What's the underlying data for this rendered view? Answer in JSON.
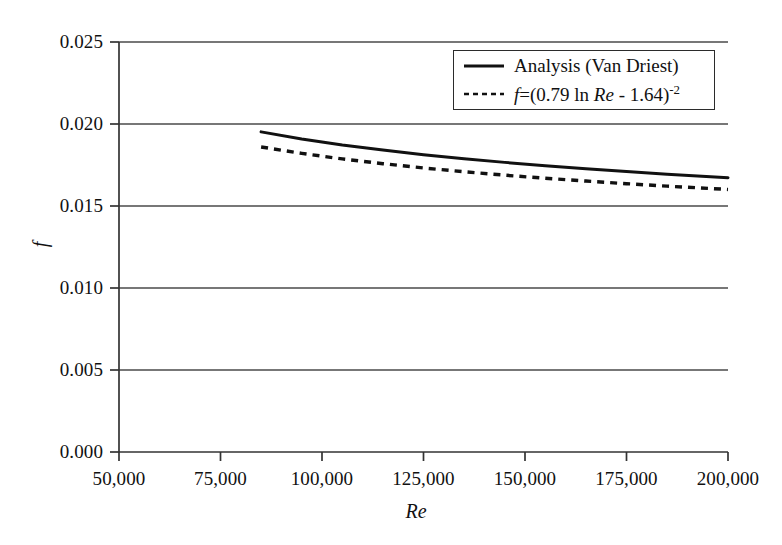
{
  "chart": {
    "type": "line",
    "xlabel": "Re",
    "ylabel": "f",
    "title": "",
    "xlim": [
      50000,
      200000
    ],
    "ylim": [
      0.0,
      0.025
    ],
    "xticks": [
      "50,000",
      "75,000",
      "100,000",
      "125,000",
      "150,000",
      "175,000",
      "200,000"
    ],
    "yticks": [
      "0.025",
      "0.020",
      "0.015",
      "0.010",
      "0.005",
      "0.000"
    ],
    "grid": "horizontal",
    "legend_position": "top-right",
    "line_color": "#111111"
  },
  "legend": {
    "items": [
      {
        "label": "Analysis (Van Driest)",
        "style": "solid"
      },
      {
        "label": "f = (0.79 ln Re - 1.64)^-2",
        "style": "dashed"
      }
    ],
    "formula": {
      "f": "f",
      "eq": "=",
      "open": "(0.79 ln",
      "re": "Re",
      "close": "- 1.64)",
      "exp": "-2"
    }
  },
  "chart_data": {
    "type": "line",
    "title": "",
    "xlabel": "Re",
    "ylabel": "f",
    "xlim": [
      50000,
      200000
    ],
    "ylim": [
      0,
      0.025
    ],
    "xticks": [
      50000,
      75000,
      100000,
      125000,
      150000,
      175000,
      200000
    ],
    "yticks": [
      0.0,
      0.005,
      0.01,
      0.015,
      0.02,
      0.025
    ],
    "grid": "horizontal gridlines at each y tick",
    "legend_position": "top-right inside plot",
    "series": [
      {
        "name": "Analysis (Van Driest)",
        "style": "solid",
        "color": "#111111",
        "x": [
          85000,
          95000,
          105000,
          115000,
          125000,
          135000,
          145000,
          155000,
          165000,
          175000,
          185000,
          200000
        ],
        "values": [
          0.01952,
          0.01909,
          0.01872,
          0.01841,
          0.01813,
          0.01788,
          0.01766,
          0.01746,
          0.01727,
          0.0171,
          0.01694,
          0.01673
        ]
      },
      {
        "name": "f = (0.79 ln Re - 1.64)^-2",
        "style": "dashed",
        "color": "#111111",
        "x": [
          85000,
          95000,
          105000,
          115000,
          125000,
          135000,
          145000,
          155000,
          165000,
          175000,
          185000,
          200000
        ],
        "values": [
          0.0186,
          0.01821,
          0.01787,
          0.01758,
          0.01732,
          0.01709,
          0.01688,
          0.01669,
          0.01652,
          0.01636,
          0.01621,
          0.01601
        ]
      }
    ]
  }
}
